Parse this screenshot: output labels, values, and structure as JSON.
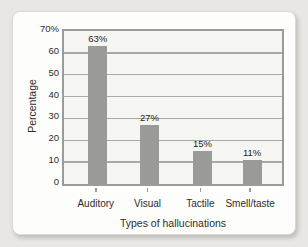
{
  "chart_data": {
    "type": "bar",
    "title": "",
    "xlabel": "Types of hallucinations",
    "ylabel": "Percentage",
    "categories": [
      "Auditory",
      "Visual",
      "Tactile",
      "Smell/taste"
    ],
    "values": [
      63,
      27,
      15,
      11
    ],
    "value_labels": [
      "63%",
      "27%",
      "15%",
      "11%"
    ],
    "ylim": [
      0,
      70
    ],
    "ytick_step": 10,
    "ytick_labels": [
      "0",
      "10",
      "20",
      "30",
      "40",
      "50",
      "60",
      "70%"
    ],
    "grid": "horizontal",
    "legend": "none",
    "bar_width_px": 19,
    "bar_center_fractions": [
      0.155,
      0.392,
      0.635,
      0.863
    ],
    "colors": {
      "page_bg": "#e9e7e3",
      "card_bg": "#fdfdfb",
      "plot_bg": "#f5f5f2",
      "bar": "#9a9a97",
      "grid": "#a9a9a6",
      "frame": "#9b9b99",
      "text": "#2e2e2c"
    }
  }
}
